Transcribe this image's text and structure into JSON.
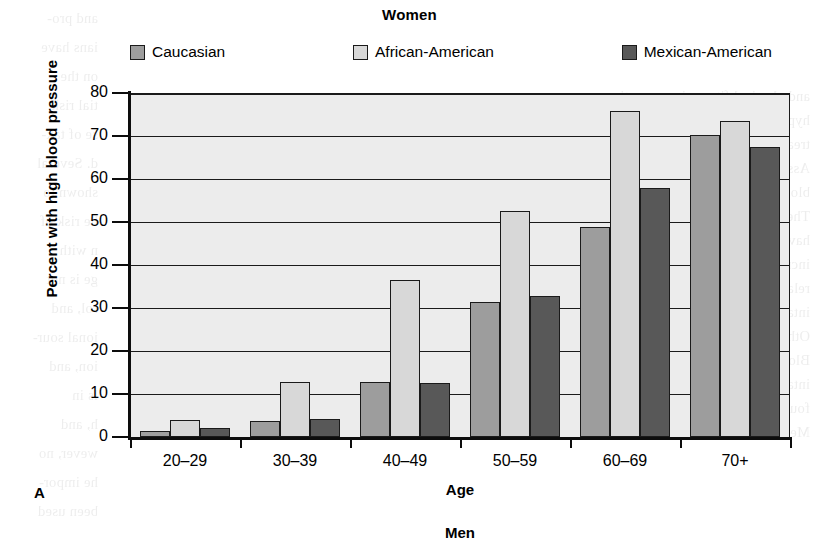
{
  "figure": {
    "panel_label": "A",
    "next_panel_title": "Men"
  },
  "chart_data": {
    "type": "bar",
    "title": "Women",
    "xlabel": "Age",
    "ylabel": "Percent with high blood pressure",
    "ylim": [
      0,
      80
    ],
    "ytick_step": 10,
    "yticks": [
      80,
      70,
      60,
      50,
      40,
      30,
      20,
      10,
      0
    ],
    "grid": true,
    "grid_axis": "y",
    "legend_position": "top",
    "categories": [
      "20–29",
      "30–39",
      "40–49",
      "50–59",
      "60–69",
      "70+"
    ],
    "series": [
      {
        "name": "Caucasian",
        "color": "#9d9d9d",
        "values": [
          1.3,
          3.8,
          12.8,
          31.3,
          48.8,
          70.3
        ]
      },
      {
        "name": "African-American",
        "color": "#d8d8d8",
        "values": [
          4.0,
          12.8,
          36.5,
          52.5,
          75.8,
          73.5
        ]
      },
      {
        "name": "Mexican-American",
        "color": "#585858",
        "values": [
          2.0,
          4.3,
          12.5,
          32.8,
          58.0,
          67.5
        ]
      }
    ]
  },
  "bleed_text": {
    "left_column": [
      "and pro-",
      "ians have",
      "on the",
      "tial risk",
      "se of tak-",
      "d. Several",
      "shown to",
      "he risk of",
      "n with",
      "ge is not",
      "rol, and",
      "ional sour-",
      "ion, and",
      "ls in",
      "h, and",
      "wever, no",
      "he impor-",
      "been used"
    ],
    "right_column": [
      "and physical fitness in preventing",
      "hypertension, and adopting similar approaches for the",
      "treatment of high blood pressure. American Heart",
      "Association. Hypertension is a condition in which the",
      "blood vessel walls are under more tension than normal.",
      "Therefore, if your diet and lifestyle are such that you",
      "have high blood pressure, you probably also have an",
      "increased risk for heart disease and stroke. A strong",
      "relationship has been shown between a high sodium",
      "intake and blood pressure levels in several studies.",
      "Other studies have not shown this relationship.",
      "Blood pressure is also influenced by weight, exercise,",
      "intake per week and how often a person drinks alcohol.",
      "four times per week. The proportions are only slightly higher for",
      "Mexican men. They from the lowest recorded blood pres-"
    ]
  }
}
